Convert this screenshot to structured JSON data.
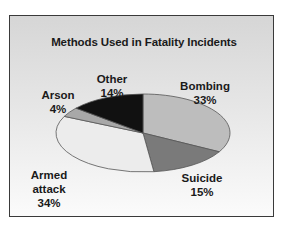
{
  "chart_data": {
    "type": "pie",
    "title": "Methods Used in Fatality Incidents",
    "slices": [
      {
        "label": "Bombing",
        "value": 33,
        "display": "33%",
        "color": "#bdbdbd"
      },
      {
        "label": "Suicide",
        "value": 15,
        "display": "15%",
        "color": "#7a7a7a"
      },
      {
        "label": "Armed attack",
        "value": 34,
        "display": "34%",
        "color": "#ececec"
      },
      {
        "label": "Arson",
        "value": 4,
        "display": "4%",
        "color": "#a8a8a8"
      },
      {
        "label": "Other",
        "value": 14,
        "display": "14%",
        "color": "#111111"
      }
    ],
    "legend": "none",
    "style": "3D-ellipse pie, grayscale, labels outside slices"
  }
}
